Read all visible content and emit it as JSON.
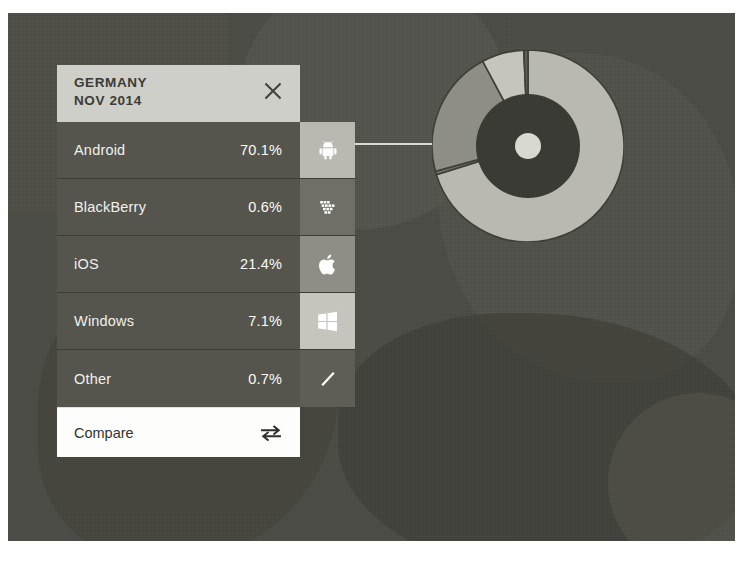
{
  "panel": {
    "header": {
      "country": "GERMANY",
      "period": "NOV 2014",
      "close_icon": "close-icon"
    },
    "rows": [
      {
        "name": "Android",
        "percent": "70.1%",
        "icon": "android-icon",
        "swatch_color": "#b9b9b1"
      },
      {
        "name": "BlackBerry",
        "percent": "0.6%",
        "icon": "blackberry-icon",
        "swatch_color": "#6f6f67"
      },
      {
        "name": "iOS",
        "percent": "21.4%",
        "icon": "apple-icon",
        "swatch_color": "#8e8e86"
      },
      {
        "name": "Windows",
        "percent": "7.1%",
        "icon": "windows-icon",
        "swatch_color": "#c5c5bd"
      },
      {
        "name": "Other",
        "percent": "0.7%",
        "icon": "slash-icon",
        "swatch_color": "#5e5e57"
      }
    ],
    "footer": {
      "compare_label": "Compare",
      "compare_icon": "swap-arrows-icon"
    }
  },
  "chart_data": {
    "type": "pie",
    "title": "GERMANY NOV 2014",
    "categories": [
      "Android",
      "BlackBerry",
      "iOS",
      "Windows",
      "Other"
    ],
    "values": [
      70.1,
      0.6,
      21.4,
      7.1,
      0.7
    ],
    "unit": "%",
    "colors": [
      "#b9b9b1",
      "#6f6f67",
      "#8e8e86",
      "#c5c5bd",
      "#5e5e57"
    ],
    "legend": "left-panel-list",
    "start_angle_deg": -90,
    "inner_disk_color": "#3b3b35",
    "center_dot_color": "#d9d9d1",
    "outer_radius": 96,
    "inner_disk_radius": 52,
    "center_dot_radius": 13,
    "separator_color": "#3f3f39"
  },
  "colors": {
    "backdrop": "#4a4a45",
    "panel_header_bg": "#cfcfc9",
    "row_bg": "#55554e",
    "footer_bg": "#fdfdfb",
    "leader_line": "#e8e8e2"
  }
}
